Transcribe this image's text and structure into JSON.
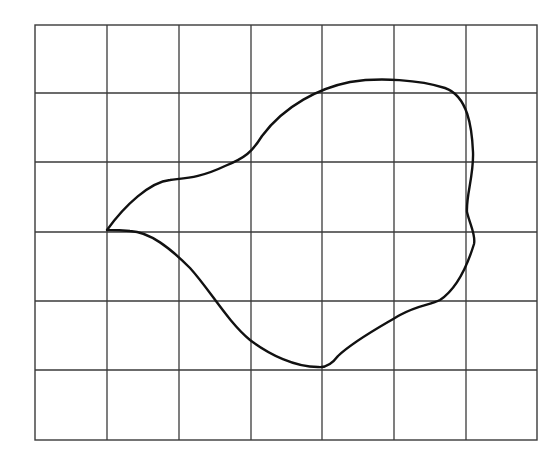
{
  "diagram": {
    "type": "shape-on-grid",
    "grid": {
      "columns": 7,
      "rows": 6,
      "x_lines": [
        35,
        107,
        179,
        251,
        322,
        394,
        466,
        537
      ],
      "y_lines": [
        25,
        93,
        162,
        232,
        301,
        370,
        440
      ],
      "line_color": "#3a3a3a"
    },
    "shape": {
      "stroke_color": "#111111",
      "fill": "none",
      "leftmost_vertex": [
        107,
        230
      ],
      "bottom_point": [
        322,
        367
      ],
      "top_point": [
        385,
        80
      ],
      "right_notch": [
        467,
        212
      ]
    }
  }
}
